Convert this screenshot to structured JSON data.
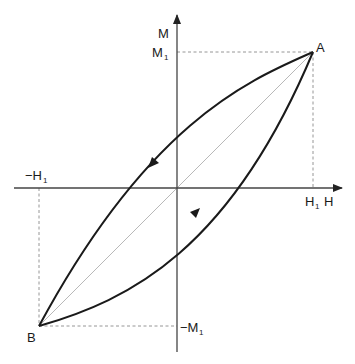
{
  "diagram": {
    "type": "hysteresis-loop",
    "axes": {
      "x_label": "H",
      "y_label": "M"
    },
    "points": {
      "A": {
        "label": "A",
        "H": "H1",
        "M": "M1"
      },
      "B": {
        "label": "B",
        "H": "-H1",
        "M": "-M1"
      }
    },
    "tick_labels": {
      "h_pos": {
        "main": "H",
        "sub": "1"
      },
      "h_neg": {
        "main": "−H",
        "sub": "1"
      },
      "m_pos": {
        "main": "M",
        "sub": "1"
      },
      "m_neg": {
        "main": "−M",
        "sub": "1"
      }
    },
    "branches": [
      {
        "name": "descending",
        "from": "A",
        "to": "B",
        "arrow": "down-left"
      },
      {
        "name": "ascending",
        "from": "B",
        "to": "A",
        "arrow": "up-right"
      }
    ],
    "colors": {
      "curve": "#1a1a1a",
      "axis": "#333333",
      "guide": "#888888",
      "diagonal": "#aaaaaa"
    }
  }
}
